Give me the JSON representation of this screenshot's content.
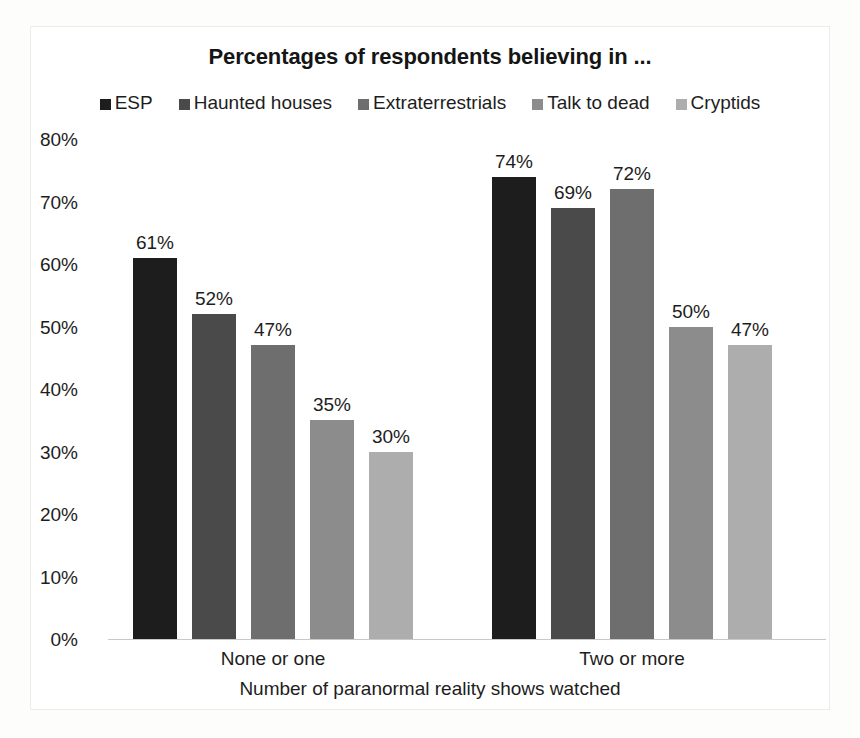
{
  "chart_data": {
    "type": "bar",
    "title": "Percentages of respondents believing in ...",
    "xlabel": "Number of paranormal reality shows watched",
    "ylabel": "",
    "categories": [
      "None or one",
      "Two or more"
    ],
    "series": [
      {
        "name": "ESP",
        "color": "#1d1d1d",
        "values": [
          61,
          74
        ],
        "labels": [
          "61%",
          "74%"
        ]
      },
      {
        "name": "Haunted houses",
        "color": "#4a4a4a",
        "values": [
          52,
          69
        ],
        "labels": [
          "52%",
          "69%"
        ]
      },
      {
        "name": "Extraterrestrials",
        "color": "#6e6e6e",
        "values": [
          47,
          72
        ],
        "labels": [
          "47%",
          "72%"
        ]
      },
      {
        "name": "Talk to dead",
        "color": "#8c8c8c",
        "values": [
          35,
          50
        ],
        "labels": [
          "35%",
          "50%"
        ]
      },
      {
        "name": "Cryptids",
        "color": "#adadad",
        "values": [
          30,
          47
        ],
        "labels": [
          "30%",
          "47%"
        ]
      }
    ],
    "ylim": [
      0,
      80
    ],
    "ytick_labels": [
      "80%",
      "70%",
      "60%",
      "50%",
      "40%",
      "30%",
      "20%",
      "10%",
      "0%"
    ],
    "ytick_values": [
      80,
      70,
      60,
      50,
      40,
      30,
      20,
      10,
      0
    ],
    "grid": false,
    "legend_position": "top"
  }
}
